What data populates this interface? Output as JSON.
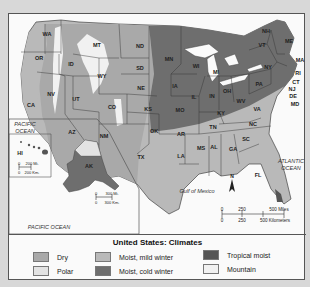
{
  "title": "United States: Climates",
  "colors": {
    "dry": "#a9a9a9",
    "polar": "#e3e3e3",
    "moist_mild": "#b9b9b9",
    "moist_cold": "#6e6e6e",
    "tropical": "#555555",
    "mountain": "#f1f1f1",
    "water": "#fafafa"
  },
  "legend": [
    {
      "key": "dry",
      "label": "Dry"
    },
    {
      "key": "polar",
      "label": "Polar"
    },
    {
      "key": "moist_mild",
      "label": "Moist, mild winter"
    },
    {
      "key": "moist_cold",
      "label": "Moist, cold winter"
    },
    {
      "key": "tropical",
      "label": "Tropical moist"
    },
    {
      "key": "mountain",
      "label": "Mountain"
    }
  ],
  "oceans": {
    "pacific_1": "PACIFIC OCEAN",
    "pacific_2": "PACIFIC OCEAN",
    "atlantic": "ATLANTIC OCEAN",
    "gulf": "Gulf of Mexico"
  },
  "states": {
    "WA": "WA",
    "OR": "OR",
    "CA": "CA",
    "ID": "ID",
    "NV": "NV",
    "MT": "MT",
    "WY": "WY",
    "UT": "UT",
    "AZ": "AZ",
    "CO": "CO",
    "NM": "NM",
    "ND": "ND",
    "SD": "SD",
    "NE": "NE",
    "KS": "KS",
    "OK": "OK",
    "TX": "TX",
    "MN": "MN",
    "IA": "IA",
    "MO": "MO",
    "AR": "AR",
    "LA": "LA",
    "WI": "WI",
    "IL": "IL",
    "MI": "MI",
    "IN": "IN",
    "OH": "OH",
    "KY": "KY",
    "TN": "TN",
    "MS": "MS",
    "AL": "AL",
    "GA": "GA",
    "FL": "FL",
    "SC": "SC",
    "NC": "NC",
    "VA": "VA",
    "WV": "WV",
    "PA": "PA",
    "NY": "NY",
    "VT": "VT",
    "NH": "NH",
    "ME": "ME",
    "MA": "MA",
    "RI": "RI",
    "CT": "CT",
    "NJ": "NJ",
    "DE": "DE",
    "MD": "MD",
    "AK": "AK",
    "HI": "HI"
  },
  "scales": {
    "main_miles": [
      "0",
      "250",
      "500 Miles"
    ],
    "main_km": [
      "0",
      "250",
      "500 Kilometers"
    ],
    "hi_miles": [
      "0",
      "200 Mi."
    ],
    "hi_km": [
      "0",
      "200 Km."
    ],
    "ak_miles": [
      "0",
      "300 Mi."
    ],
    "ak_km": [
      "0",
      "300 Km."
    ]
  },
  "compass": "N"
}
